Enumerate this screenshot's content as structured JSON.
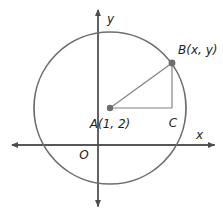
{
  "figure": {
    "type": "geometry-diagram",
    "background_color": "#ffffff",
    "stroke_color": "#6d6e71",
    "text_color": "#231f20",
    "axes": {
      "origin_label": "O",
      "x_axis_label": "x",
      "y_axis_label": "y",
      "origin_px": {
        "x": 98,
        "y": 145
      },
      "x_axis_y_px": 145,
      "y_axis_x_px": 98
    },
    "circle": {
      "center_px": {
        "x": 110,
        "y": 108
      },
      "radius_px": 76,
      "stroke_width": 1.6
    },
    "points": [
      {
        "name": "A",
        "label": "A(1, 2)",
        "role": "center",
        "px": {
          "x": 110,
          "y": 108
        },
        "label_px": {
          "x": 110,
          "y": 127
        },
        "dot": true
      },
      {
        "name": "B",
        "label": "B(x, y)",
        "role": "on-circle",
        "px": {
          "x": 172,
          "y": 63
        },
        "label_px": {
          "x": 178,
          "y": 54
        },
        "dot": true
      },
      {
        "name": "C",
        "label": "C",
        "role": "right-angle-vertex",
        "px": {
          "x": 172,
          "y": 108
        },
        "label_px": {
          "x": 173,
          "y": 126
        },
        "dot": false
      }
    ],
    "segments": [
      {
        "name": "AB",
        "from": "A",
        "to": "B",
        "style": "solid"
      },
      {
        "name": "AC",
        "from": "A",
        "to": "C",
        "style": "solid"
      },
      {
        "name": "BC",
        "from": "B",
        "to": "C",
        "style": "solid"
      }
    ]
  }
}
